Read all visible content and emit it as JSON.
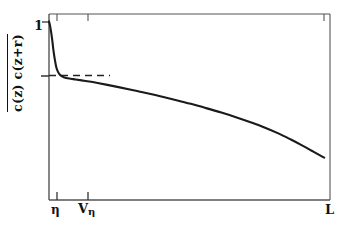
{
  "figure": {
    "background_color": "#ffffff",
    "line_color": "#1a1a1a",
    "frame_color": "#444444"
  },
  "axes": {
    "y_label": "c(z) c(z+r)",
    "y_label_has_overbar": true,
    "y_tick_top_label": "1",
    "x_tick_labels": {
      "eta": "η",
      "v_eta_base": "V",
      "v_eta_sub": "η",
      "L": "L"
    }
  },
  "chart_data": {
    "type": "line",
    "title": "",
    "xlabel": "",
    "ylabel": "c(z) c(z+r)",
    "grid": false,
    "legend": null,
    "annotations": [
      {
        "type": "dashed-horizontal-line",
        "y": 0.655,
        "x_start": 0.0,
        "x_end": 0.217,
        "note": "plateau level reference"
      }
    ],
    "x_tick_positions": [
      0.028,
      0.138,
      1.0
    ],
    "x_tick_text": [
      "η",
      "Vη",
      "L"
    ],
    "y_tick_positions": [
      1.0,
      0.655
    ],
    "y_tick_text": [
      "1",
      ""
    ],
    "xlim": [
      0,
      1
    ],
    "ylim": [
      0,
      1
    ],
    "series": [
      {
        "name": "correlation",
        "x": [
          0.0,
          0.004,
          0.008,
          0.012,
          0.016,
          0.021,
          0.026,
          0.032,
          0.04,
          0.05,
          0.062,
          0.078,
          0.096,
          0.118,
          0.145,
          0.175,
          0.21,
          0.25,
          0.295,
          0.345,
          0.4,
          0.455,
          0.51,
          0.565,
          0.62,
          0.675,
          0.725,
          0.775,
          0.825,
          0.87,
          0.91,
          0.945,
          0.975,
          0.99
        ],
        "y": [
          0.96,
          0.935,
          0.9,
          0.855,
          0.805,
          0.755,
          0.715,
          0.69,
          0.672,
          0.662,
          0.656,
          0.652,
          0.648,
          0.643,
          0.637,
          0.629,
          0.619,
          0.607,
          0.593,
          0.577,
          0.558,
          0.538,
          0.517,
          0.494,
          0.47,
          0.444,
          0.418,
          0.39,
          0.358,
          0.325,
          0.294,
          0.265,
          0.24,
          0.228
        ]
      }
    ]
  }
}
